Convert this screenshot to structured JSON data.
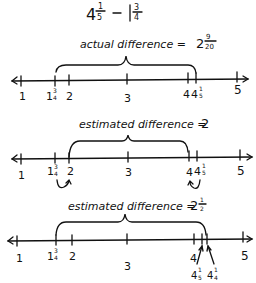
{
  "title": {
    "expression": "4 1/5 − 1 3/4",
    "whole1": "4",
    "num1": "1",
    "den1": "5",
    "minus": "−",
    "whole2": "1",
    "num2": "3",
    "den2": "4"
  },
  "lines": [
    {
      "label": "actual difference = 2",
      "label_text": "actual difference =",
      "result_whole": "2",
      "result_num": "9",
      "result_den": "20",
      "ticks": [
        {
          "value": "1",
          "x": 21
        },
        {
          "value": "1 3/4",
          "x": 55
        },
        {
          "value": "2",
          "x": 69
        },
        {
          "value": "3",
          "x": 127
        },
        {
          "value": "4",
          "x": 188
        },
        {
          "value": "4 1/5",
          "x": 196
        },
        {
          "value": "5",
          "x": 237
        }
      ],
      "brace": {
        "from": "1 3/4",
        "to": "4 1/5"
      }
    },
    {
      "label_text": "estimated difference =",
      "result_whole": "2",
      "ticks": [
        {
          "value": "1",
          "x": 21
        },
        {
          "value": "1 3/4",
          "x": 55
        },
        {
          "value": "2",
          "x": 69
        },
        {
          "value": "3",
          "x": 128
        },
        {
          "value": "4",
          "x": 189
        },
        {
          "value": "4 1/5",
          "x": 197
        },
        {
          "value": "5",
          "x": 240
        }
      ],
      "brace": {
        "from": "2",
        "to": "4"
      },
      "rounding_arrows": [
        "1 3/4 → 2",
        "4 1/5 → 4"
      ]
    },
    {
      "label_text": "estimated difference =",
      "result_whole": "2",
      "result_num": "1",
      "result_den": "2",
      "ticks": [
        {
          "value": "1",
          "x": 17
        },
        {
          "value": "1 3/4",
          "x": 56
        },
        {
          "value": "2",
          "x": 72
        },
        {
          "value": "3",
          "x": 127
        },
        {
          "value": "4",
          "x": 194
        },
        {
          "value": "4 1/5",
          "x": 202
        },
        {
          "value": "4 1/4",
          "x": 207
        },
        {
          "value": "5",
          "x": 243
        }
      ],
      "brace": {
        "from": "1 3/4",
        "to": "4 1/4"
      },
      "pointer_labels": [
        "4 1/5",
        "4 1/4"
      ]
    }
  ],
  "labels": {
    "one": "1",
    "two": "2",
    "three": "3",
    "four": "4",
    "five": "5",
    "frac_1_5_num": "1",
    "frac_1_5_den": "5",
    "frac_3_4_num": "3",
    "frac_3_4_den": "4",
    "frac_1_4_num": "1",
    "frac_1_4_den": "4"
  },
  "colors": {
    "ink": "#111111",
    "background": "#ffffff"
  }
}
